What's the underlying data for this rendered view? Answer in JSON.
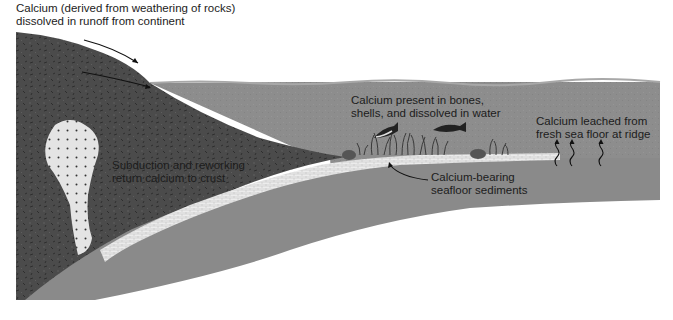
{
  "diagram": {
    "colors": {
      "background": "#ffffff",
      "continent": "#4b4b4b",
      "ocean": "#8d8d8d",
      "oceanic_plate": "#8a8a8a",
      "sediment": "#e6e6e6",
      "magma": "#e4e4e4",
      "text": "#1c1c1c"
    },
    "labels": {
      "runoff": "Calcium (derived from weathering of rocks)\ndissolved in runoff from continent",
      "biota": "Calcium present in bones,\nshells, and dissolved in water",
      "ridge": "Calcium leached from\nfresh sea floor at ridge",
      "subduction": "Subduction and reworking\nreturn calcium to crust",
      "sediments": "Calcium-bearing\nseafloor sediments"
    },
    "regions": [
      {
        "name": "continent",
        "kind": "continental-crust"
      },
      {
        "name": "ocean",
        "kind": "seawater"
      },
      {
        "name": "oceanic-plate",
        "kind": "subducting-oceanic-crust"
      },
      {
        "name": "sediment-layer",
        "kind": "calcium-bearing-sediments"
      },
      {
        "name": "magma-body",
        "kind": "intrusion"
      }
    ],
    "icons": [
      "runoff-arrow-icon",
      "groundwater-arrow-icon",
      "fish-icon",
      "fish-icon",
      "seagrass-icon",
      "rock-icon",
      "leach-arrow-icon",
      "leach-arrow-icon",
      "leach-arrow-icon",
      "pointer-arrow-icon"
    ]
  }
}
